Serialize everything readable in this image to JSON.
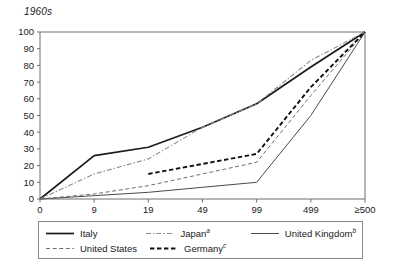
{
  "chart_title": "1960s",
  "legend": {
    "rows": [
      [
        {
          "label": "Italy",
          "note": "",
          "style": "solid-thick",
          "key": "italy"
        },
        {
          "label": "Japan",
          "note": "a",
          "style": "dashdot",
          "key": "japan"
        },
        {
          "label": "United Kingdom",
          "note": "b",
          "style": "solid-thin",
          "key": "united_kingdom"
        }
      ],
      [
        {
          "label": "United States",
          "note": "",
          "style": "dashed-thin",
          "key": "united_states"
        },
        {
          "label": "Germany",
          "note": "c",
          "style": "dashed-thick",
          "key": "germany"
        }
      ]
    ]
  },
  "chart_data": {
    "type": "line",
    "title": "1960s",
    "xlabel": "",
    "ylabel": "",
    "categories": [
      "0",
      "9",
      "19",
      "49",
      "99",
      "499",
      "≥500"
    ],
    "ylim": [
      0,
      100
    ],
    "yticks": [
      0,
      10,
      20,
      30,
      40,
      50,
      60,
      70,
      80,
      90,
      100
    ],
    "grid": false,
    "legend_position": "bottom",
    "series": [
      {
        "name": "Italy",
        "note": "",
        "style": "solid-thick",
        "values": [
          0,
          26,
          31,
          43,
          57,
          79,
          100
        ]
      },
      {
        "name": "Japan",
        "note": "a",
        "style": "dashdot",
        "values": [
          0,
          15,
          24,
          43,
          57,
          83,
          100
        ]
      },
      {
        "name": "United Kingdom",
        "note": "b",
        "style": "solid-thin",
        "values": [
          0,
          2,
          4,
          7,
          10,
          50,
          100
        ]
      },
      {
        "name": "United States",
        "note": "",
        "style": "dashed-thin",
        "values": [
          0,
          3,
          8,
          15,
          22,
          62,
          100
        ]
      },
      {
        "name": "Germany",
        "note": "c",
        "style": "dashed-thick",
        "values": [
          null,
          null,
          15,
          21,
          27,
          67,
          100
        ]
      }
    ]
  }
}
